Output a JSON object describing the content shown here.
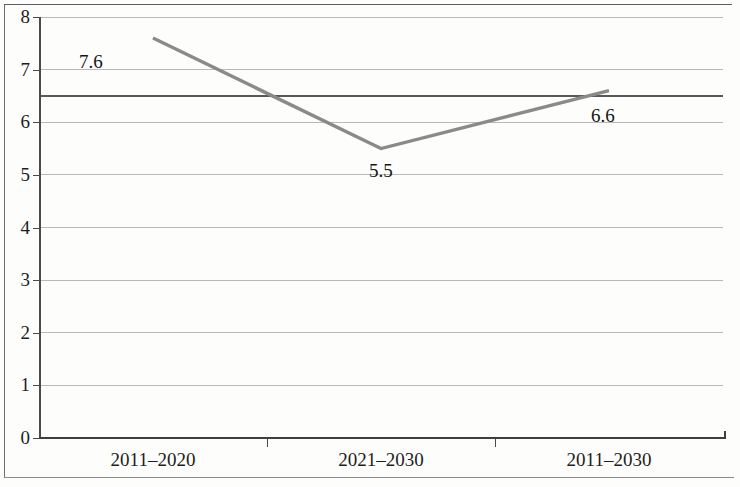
{
  "chart_data": {
    "type": "line",
    "title": "",
    "subtitle": "",
    "xlabel": "",
    "ylabel": "",
    "categories": [
      "2011–2020",
      "2021–2030",
      "2011–2030"
    ],
    "values": [
      7.6,
      5.5,
      6.6
    ],
    "point_labels": [
      "7.6",
      "5.5",
      "6.6"
    ],
    "series": [
      {
        "name": "",
        "values": [
          7.6,
          5.5,
          6.6
        ],
        "color": "#8a8a8a"
      }
    ],
    "ylim": [
      0,
      8
    ],
    "ytick_step": 1,
    "ytick_labels": [
      "8",
      "7",
      "6",
      "5",
      "4",
      "3",
      "2",
      "1",
      "0"
    ],
    "ytick_values": [
      8,
      7,
      6,
      5,
      4,
      3,
      2,
      1,
      0
    ],
    "grid": true,
    "grid_color": "#b9b9b9",
    "reference_line": {
      "value": 6.5,
      "label": "",
      "color": "#585858"
    },
    "legend": false,
    "legend_position": "none",
    "axis_color": "#4a4a4a",
    "background_color": "#fdfdfc"
  }
}
